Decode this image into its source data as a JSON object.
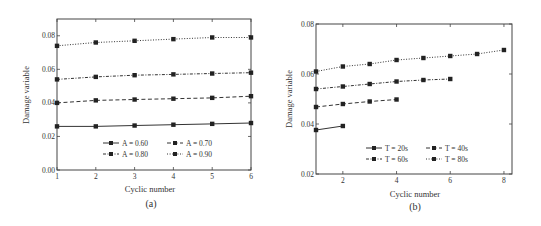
{
  "chart_data": [
    {
      "id": "a",
      "type": "line",
      "caption": "(a)",
      "title": "",
      "xlabel": "Cyclic number",
      "ylabel": "Damage variable",
      "xlim": [
        1,
        6
      ],
      "ylim": [
        0.0,
        0.09
      ],
      "xticks": [
        1,
        2,
        3,
        4,
        5,
        6
      ],
      "yticks": [
        0.0,
        0.02,
        0.04,
        0.06,
        0.08
      ],
      "ytick_labels": [
        "0.00",
        "0.02",
        "0.04",
        "0.06",
        "0.08"
      ],
      "grid": false,
      "legend_position": "lower center",
      "series": [
        {
          "name": "A = 0.60",
          "line_style": "solid",
          "x": [
            1,
            2,
            3,
            4,
            5,
            6
          ],
          "values": [
            0.026,
            0.026,
            0.0265,
            0.027,
            0.0275,
            0.028
          ]
        },
        {
          "name": "A = 0.70",
          "line_style": "dashed",
          "x": [
            1,
            2,
            3,
            4,
            5,
            6
          ],
          "values": [
            0.04,
            0.0415,
            0.042,
            0.0425,
            0.043,
            0.044
          ]
        },
        {
          "name": "A = 0.80",
          "line_style": "dashdot",
          "x": [
            1,
            2,
            3,
            4,
            5,
            6
          ],
          "values": [
            0.054,
            0.0555,
            0.0565,
            0.057,
            0.0575,
            0.058
          ]
        },
        {
          "name": "A = 0.90",
          "line_style": "dotted",
          "x": [
            1,
            2,
            3,
            4,
            5,
            6
          ],
          "values": [
            0.074,
            0.076,
            0.077,
            0.078,
            0.079,
            0.079
          ]
        }
      ]
    },
    {
      "id": "b",
      "type": "line",
      "caption": "(b)",
      "title": "",
      "xlabel": "Cyclic number",
      "ylabel": "Damage variable",
      "xlim": [
        1,
        8.3
      ],
      "ylim": [
        0.02,
        0.08
      ],
      "xticks": [
        2,
        4,
        6,
        8
      ],
      "yticks": [
        0.02,
        0.04,
        0.06,
        0.08
      ],
      "ytick_labels": [
        "0.02",
        "0.04",
        "0.06",
        "0.08"
      ],
      "grid": false,
      "legend_position": "lower right",
      "series": [
        {
          "name": "T = 20s",
          "line_style": "solid",
          "x": [
            1,
            2
          ],
          "values": [
            0.0376,
            0.0392
          ]
        },
        {
          "name": "T = 40s",
          "line_style": "dashed",
          "x": [
            1,
            2,
            3,
            4
          ],
          "values": [
            0.0468,
            0.048,
            0.049,
            0.0498
          ]
        },
        {
          "name": "T = 60s",
          "line_style": "dashdot",
          "x": [
            1,
            2,
            3,
            4,
            5,
            6
          ],
          "values": [
            0.054,
            0.055,
            0.056,
            0.057,
            0.0576,
            0.058
          ]
        },
        {
          "name": "T = 80s",
          "line_style": "dotted",
          "x": [
            1,
            2,
            3,
            4,
            5,
            6,
            7,
            8
          ],
          "values": [
            0.061,
            0.063,
            0.064,
            0.0656,
            0.0664,
            0.0672,
            0.068,
            0.0696
          ]
        }
      ]
    }
  ]
}
